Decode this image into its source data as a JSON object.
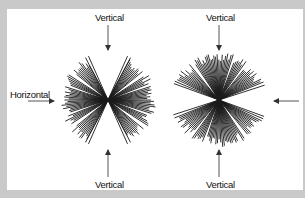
{
  "diagram": {
    "labels": {
      "left_top": "Vertical",
      "left_bottom": "Vertical",
      "left_side": "Horizontal",
      "right_top": "Vertical",
      "right_bottom": "Vertical"
    },
    "figures": [
      {
        "name": "horizontal-biased-star",
        "center": [
          108,
          100
        ],
        "orientation_bias": "horizontal"
      },
      {
        "name": "vertical-biased-star",
        "center": [
          219,
          100
        ],
        "orientation_bias": "vertical"
      }
    ],
    "colors": {
      "frame": "#c9c9c9",
      "background": "#ffffff",
      "lines": "#1a1a1a",
      "arrows": "#444444"
    }
  }
}
